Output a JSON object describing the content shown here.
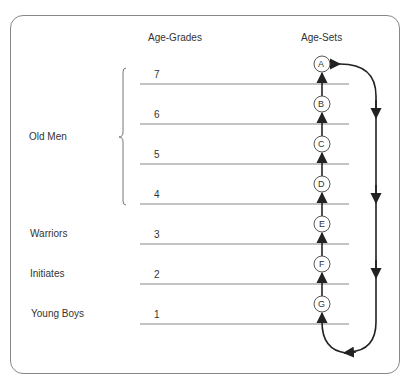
{
  "diagram": {
    "title_left": "Age-Grades",
    "title_right": "Age-Sets",
    "groups": [
      {
        "label": "Old Men",
        "grades": [
          "7",
          "6",
          "5",
          "4"
        ]
      },
      {
        "label": "Warriors",
        "grades": [
          "3"
        ]
      },
      {
        "label": "Initiates",
        "grades": [
          "2"
        ]
      },
      {
        "label": "Young Boys",
        "grades": [
          "1"
        ]
      }
    ],
    "grades": [
      "7",
      "6",
      "5",
      "4",
      "3",
      "2",
      "1"
    ],
    "age_sets": [
      "A",
      "B",
      "C",
      "D",
      "E",
      "F",
      "G"
    ],
    "flow": "Age-sets move up one grade; set A exits top and cycles back to enter at bottom (G position)",
    "colors": {
      "line": "#888888",
      "arrow": "#222222",
      "text": "#333333",
      "border": "#888888"
    }
  }
}
